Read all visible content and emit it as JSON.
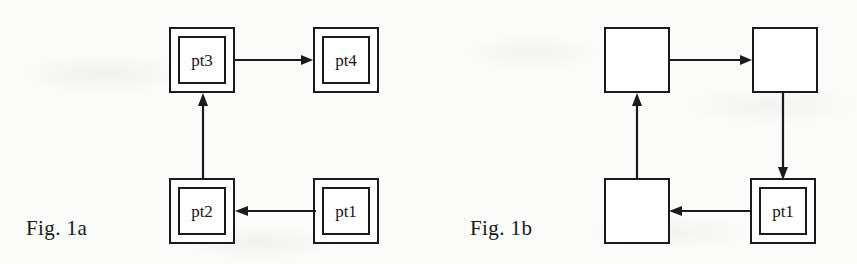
{
  "page": {
    "width": 857,
    "height": 264,
    "background_color": "#fbfbfa",
    "ink_color": "#1b1b1e"
  },
  "figures": [
    {
      "id": "fig-1a",
      "caption": "Fig. 1a",
      "caption_x": 26,
      "caption_y": 216,
      "nodes": [
        {
          "id": "fig1a-pt3",
          "label": "pt3",
          "style": "double",
          "x": 169,
          "y": 27,
          "w": 66,
          "h": 66,
          "inner_inset": 9
        },
        {
          "id": "fig1a-pt4",
          "label": "pt4",
          "style": "double",
          "x": 313,
          "y": 27,
          "w": 66,
          "h": 66,
          "inner_inset": 9
        },
        {
          "id": "fig1a-pt2",
          "label": "pt2",
          "style": "double",
          "x": 169,
          "y": 178,
          "w": 66,
          "h": 66,
          "inner_inset": 9
        },
        {
          "id": "fig1a-pt1",
          "label": "pt1",
          "style": "double",
          "x": 313,
          "y": 178,
          "w": 66,
          "h": 66,
          "inner_inset": 9
        }
      ],
      "edges": [
        {
          "id": "fig1a-edge-pt3-pt4",
          "from": "pt3",
          "to": "pt4",
          "direction": "right"
        },
        {
          "id": "fig1a-edge-pt2-pt3",
          "from": "pt2",
          "to": "pt3",
          "direction": "up"
        },
        {
          "id": "fig1a-edge-pt1-pt2",
          "from": "pt1",
          "to": "pt2",
          "direction": "left"
        }
      ]
    },
    {
      "id": "fig-1b",
      "caption": "Fig. 1b",
      "caption_x": 470,
      "caption_y": 216,
      "nodes": [
        {
          "id": "fig1b-topleft",
          "label": "",
          "style": "single",
          "x": 604,
          "y": 27,
          "w": 66,
          "h": 66,
          "inner_inset": 0
        },
        {
          "id": "fig1b-topright",
          "label": "",
          "style": "single",
          "x": 752,
          "y": 27,
          "w": 66,
          "h": 66,
          "inner_inset": 0
        },
        {
          "id": "fig1b-bottomleft",
          "label": "",
          "style": "single",
          "x": 604,
          "y": 178,
          "w": 66,
          "h": 66,
          "inner_inset": 0
        },
        {
          "id": "fig1b-pt1",
          "label": "pt1",
          "style": "double",
          "x": 750,
          "y": 178,
          "w": 66,
          "h": 66,
          "inner_inset": 9
        }
      ],
      "edges": [
        {
          "id": "fig1b-edge-topleft-topright",
          "from": "topleft",
          "to": "topright",
          "direction": "right"
        },
        {
          "id": "fig1b-edge-topright-pt1",
          "from": "topright",
          "to": "pt1",
          "direction": "down"
        },
        {
          "id": "fig1b-edge-pt1-bottomleft",
          "from": "pt1",
          "to": "bottomleft",
          "direction": "left"
        },
        {
          "id": "fig1b-edge-bottomleft-topleft",
          "from": "bottomleft",
          "to": "topleft",
          "direction": "up"
        }
      ]
    }
  ]
}
